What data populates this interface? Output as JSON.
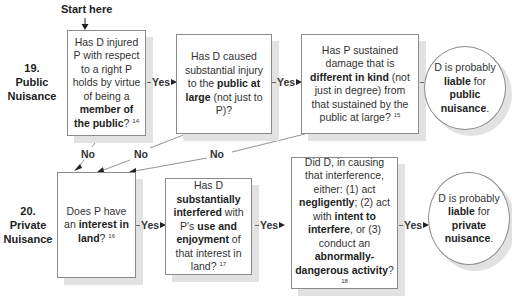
{
  "start_label": "Start here",
  "sections": [
    {
      "number": "19.",
      "line1": "Public",
      "line2": "Nuisance"
    },
    {
      "number": "20.",
      "line1": "Private",
      "line2": "Nuisance"
    }
  ],
  "connectors": {
    "yes": "Yes",
    "no": "No"
  },
  "public": {
    "q1": {
      "t1": "Has D injured P with respect to a right P holds by virtue of being a ",
      "b1": "member of the public",
      "t2": "?",
      "note": "14"
    },
    "q2": {
      "t1": "Has D caused substantial injury to the ",
      "b1": "public at large",
      "t2": " (not just to P)?"
    },
    "q3": {
      "t1": "Has P sustained damage that is ",
      "b1": "different in kind",
      "t2": " (not just in degree) from that sustained by the public at large?",
      "note": "15"
    },
    "result": {
      "t1": "D is probably ",
      "b1": "liable",
      "t2": " for ",
      "b2": "public nuisance",
      "t3": "."
    }
  },
  "private": {
    "q1": {
      "t1": "Does P have an ",
      "b1": "interest in land",
      "t2": "?",
      "note": "16"
    },
    "q2": {
      "t1": "Has D ",
      "b1": "substantially interfered",
      "t2": " with P's ",
      "b2": "use and enjoyment",
      "t3": " of that interest in land?",
      "note": "17"
    },
    "q3": {
      "t1": "Did D, in causing that interference, either: (1) act ",
      "b1": "negligently",
      "t2": "; (2) act with ",
      "b2": "intent to interfere",
      "t3": ", or (3) conduct an ",
      "b3": "abnormally-dangerous activity",
      "t4": "?",
      "note": "18"
    },
    "result": {
      "t1": "D is probably ",
      "b1": "liable",
      "t2": " for ",
      "b2": "private nuisance",
      "t3": "."
    }
  }
}
